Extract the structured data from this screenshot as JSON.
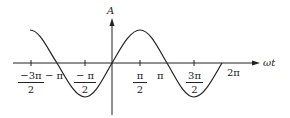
{
  "diagram": {
    "y_axis_label": "A",
    "x_axis_label": "ωt",
    "curve": "sine",
    "ticks": [
      {
        "num": "−3π",
        "den": "2"
      },
      {
        "label": "− π"
      },
      {
        "num": "− π",
        "den": "2"
      },
      {
        "num": "π",
        "den": "2"
      },
      {
        "label": "π"
      },
      {
        "num": "3π",
        "den": "2"
      },
      {
        "label": "2π"
      }
    ],
    "colors": {
      "line": "#222222",
      "background": "#ffffff"
    }
  }
}
